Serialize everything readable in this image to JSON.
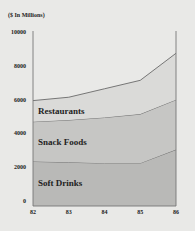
{
  "chart_data": {
    "type": "area",
    "stacked": true,
    "title": "",
    "ylabel": "($ In Millions)",
    "xlabel": "",
    "categories": [
      "82",
      "83",
      "84",
      "85",
      "86"
    ],
    "yticks": [
      "10000",
      "8000",
      "6000",
      "4000",
      "2000",
      "0"
    ],
    "ylim": [
      0,
      10000
    ],
    "grid": false,
    "legend_position": "inline labels",
    "series": [
      {
        "name": "Soft Drinks",
        "values": [
          2400,
          2350,
          2300,
          2300,
          3100
        ],
        "color": "#b9b9b7"
      },
      {
        "name": "Snack Foods",
        "values": [
          2350,
          2500,
          2700,
          2900,
          2950
        ],
        "color": "#c6c6c4"
      },
      {
        "name": "Restaurants",
        "values": [
          1250,
          1350,
          1700,
          2000,
          2750
        ],
        "color": "#dadad8"
      }
    ]
  },
  "labels": {
    "unit": "($ In Millions)",
    "soft_drinks": "Soft Drinks",
    "snack_foods": "Snack Foods",
    "restaurants": "Restaurants"
  }
}
